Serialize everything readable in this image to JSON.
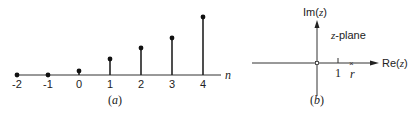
{
  "panel_a": {
    "caption": "(a)",
    "axis_label": "n",
    "stems": [
      {
        "n": "-2",
        "x": 17,
        "top": 75
      },
      {
        "n": "-1",
        "x": 48,
        "top": 75
      },
      {
        "n": "0",
        "x": 79,
        "top": 71
      },
      {
        "n": "1",
        "x": 110,
        "top": 59
      },
      {
        "n": "2",
        "x": 141,
        "top": 48
      },
      {
        "n": "3",
        "x": 172,
        "top": 38
      },
      {
        "n": "4",
        "x": 203,
        "top": 17
      }
    ]
  },
  "panel_b": {
    "caption": "(b)",
    "im_label": "Im(z)",
    "re_label": "Re(z)",
    "plane_label": "z-plane",
    "tick_label": "1",
    "pole_label": "r"
  },
  "chart_data": {
    "type": "stem",
    "title": "",
    "xlabel": "n",
    "ylabel": "",
    "x": [
      -2,
      -1,
      0,
      1,
      2,
      3,
      4
    ],
    "values": [
      0,
      0,
      0.25,
      1.0,
      1.7,
      2.3,
      3.6
    ],
    "note": "Right-sided growing sequence (values estimated from stem heights); panel (b) z-plane with zero at origin and pole x at r > 1"
  }
}
